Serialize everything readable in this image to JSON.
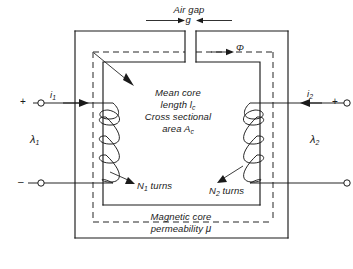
{
  "figure": {
    "type": "engineering-schematic",
    "colors": {
      "line": "#1a1a1a",
      "background": "#ffffff",
      "dashed": "#1a1a1a"
    }
  },
  "labels": {
    "air_gap": "Air gap",
    "gap_symbol": "g",
    "flux_symbol": "Φ",
    "mean_core_line1": "Mean core",
    "mean_core_line2a": "length l",
    "mean_core_line2b": "c",
    "cross_section_line1": "Cross sectional",
    "cross_section_line2a": "area A",
    "cross_section_line2b": "c",
    "n1_turns_a": "N",
    "n1_turns_b": "1",
    "n1_turns_c": " turns",
    "n2_turns_a": "N",
    "n2_turns_b": "2",
    "n2_turns_c": " turns",
    "magnetic_core": "Magnetic core",
    "permeability_a": "permeability ",
    "permeability_b": "μ",
    "current_1_a": "i",
    "current_1_b": "1",
    "current_2_a": "i",
    "current_2_b": "2",
    "lambda_1_a": "λ",
    "lambda_1_b": "1",
    "lambda_2_a": "λ",
    "lambda_2_b": "2",
    "terminal_left_positive": "+",
    "terminal_left_negative": "–",
    "terminal_right_positive": "+",
    "terminal_right_negative": "–"
  }
}
